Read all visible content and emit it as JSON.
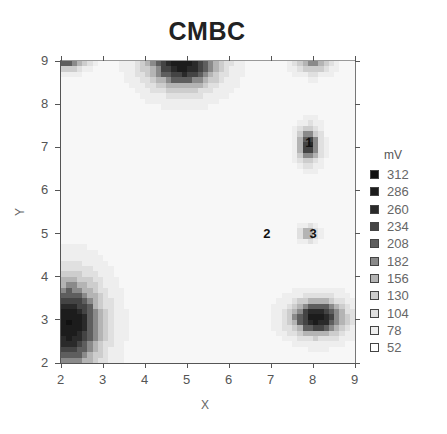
{
  "chart_data": {
    "type": "heatmap",
    "title": "CMBC",
    "xlabel": "X",
    "ylabel": "Y",
    "xlim": [
      2,
      9
    ],
    "ylim": [
      2,
      9
    ],
    "xticks": [
      2,
      3,
      4,
      5,
      6,
      7,
      8,
      9
    ],
    "yticks": [
      2,
      3,
      4,
      5,
      6,
      7,
      8,
      9
    ],
    "grid": false,
    "legend": {
      "title": "mV",
      "position": "right",
      "levels": [
        312,
        286,
        260,
        234,
        208,
        182,
        156,
        130,
        104,
        78,
        52
      ]
    },
    "level_colors": [
      "#111111",
      "#1c1c1c",
      "#2a2a2a",
      "#444444",
      "#5e5e5e",
      "#8a8a8a",
      "#b4b4b4",
      "#cdcdcd",
      "#e0e0e0",
      "#eeeeee",
      "#f7f7f7"
    ],
    "hotspots": [
      {
        "x": 2.2,
        "y": 2.9,
        "peak": 300,
        "sx": 0.55,
        "sy": 0.75,
        "label": "bottom-left max"
      },
      {
        "x": 4.9,
        "y": 9.0,
        "peak": 300,
        "sx": 0.6,
        "sy": 0.45,
        "label": "top-center max"
      },
      {
        "x": 8.1,
        "y": 3.05,
        "peak": 290,
        "sx": 0.45,
        "sy": 0.3,
        "label": "bottom-right max"
      },
      {
        "x": 7.9,
        "y": 7.05,
        "peak": 260,
        "sx": 0.18,
        "sy": 0.28,
        "label": "electrode 1"
      },
      {
        "x": 7.9,
        "y": 5.0,
        "peak": 190,
        "sx": 0.14,
        "sy": 0.12,
        "label": "electrode 3"
      },
      {
        "x": 8.0,
        "y": 9.0,
        "peak": 180,
        "sx": 0.3,
        "sy": 0.2,
        "label": "top-right"
      },
      {
        "x": 2.1,
        "y": 9.0,
        "peak": 220,
        "sx": 0.35,
        "sy": 0.15,
        "label": "top-left edge"
      }
    ],
    "background_mV": 55,
    "markers": [
      {
        "label": "1",
        "x": 7.9,
        "y": 7.1
      },
      {
        "label": "2",
        "x": 6.9,
        "y": 5.0
      },
      {
        "label": "3",
        "x": 8.0,
        "y": 5.0
      }
    ]
  },
  "title": "CMBC",
  "xlabel": "X",
  "ylabel": "Y",
  "legend_title": "mV",
  "legend_levels": [
    "312",
    "286",
    "260",
    "234",
    "208",
    "182",
    "156",
    "130",
    "104",
    "78",
    "52"
  ],
  "markers": [
    "1",
    "2",
    "3"
  ]
}
